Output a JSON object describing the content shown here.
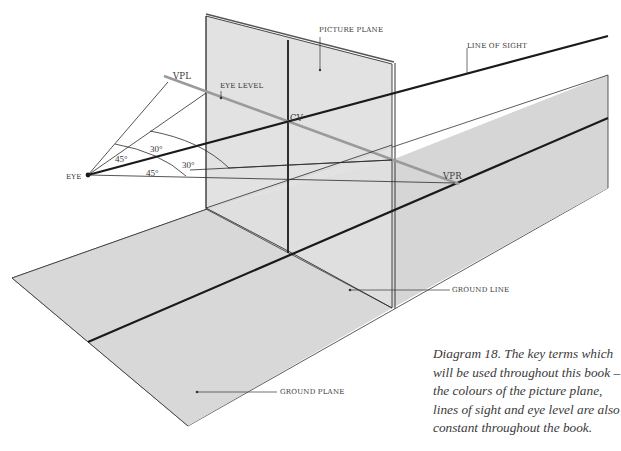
{
  "figure": {
    "title": "Diagram 18",
    "caption_lines": [
      "Diagram 18. The key terms which",
      "will be used throughout this book –",
      "the colours of the picture plane,",
      "lines of sight and eye level are also",
      "constant throughout the book."
    ]
  },
  "labels": {
    "picture_plane": "PICTURE PLANE",
    "line_of_sight": "LINE OF SIGHT",
    "eye_level": "EYE LEVEL",
    "vpl": "VPL",
    "vpr": "VPR",
    "cv": "CV",
    "eye": "EYE",
    "ground_line": "GROUND LINE",
    "ground_plane": "GROUND PLANE"
  },
  "angles": {
    "left_outer": "45°",
    "left_inner": "30°",
    "right_inner": "30°",
    "right_outer": "45°"
  },
  "colors": {
    "background": "#ffffff",
    "plane_fill": "#d9d9d9",
    "picture_plane_fill": "#dedede",
    "line_of_sight": "#1a1a1a",
    "eye_level": "#9a9a9a",
    "construction_line": "#2a2a2a",
    "label_text": "#3a3a3a"
  }
}
